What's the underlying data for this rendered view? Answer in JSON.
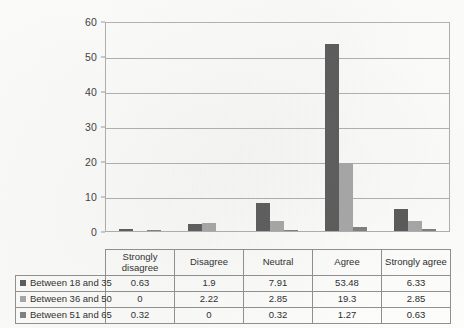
{
  "chart_data": {
    "type": "bar",
    "title": "",
    "subtitle": "",
    "xlabel": "",
    "ylabel": "",
    "categories": [
      "Strongly disagree",
      "Disagree",
      "Neutral",
      "Agree",
      "Strongly agree"
    ],
    "category_labels_wrapped": [
      [
        "Strongly",
        "disagree"
      ],
      [
        "Disagree"
      ],
      [
        "Neutral"
      ],
      [
        "Agree"
      ],
      [
        "Strongly agree"
      ]
    ],
    "series": [
      {
        "name": "Between 18 and 35",
        "color": "#595959",
        "values": [
          0.63,
          1.9,
          7.91,
          53.48,
          6.33
        ]
      },
      {
        "name": "Between 36 and 50",
        "color": "#a6a6a6",
        "values": [
          0,
          2.22,
          2.85,
          19.3,
          2.85
        ]
      },
      {
        "name": "Between 51 and 65",
        "color": "#7f7f7f",
        "values": [
          0.32,
          0,
          0.32,
          1.27,
          0.63
        ]
      }
    ],
    "ylim": [
      0,
      60
    ],
    "yticks": [
      0,
      10,
      20,
      30,
      40,
      50,
      60
    ],
    "ytick_labels": [
      "0",
      "10",
      "20",
      "30",
      "40",
      "50",
      "60"
    ],
    "grid": "horizontal",
    "legend_position": "table-first-column",
    "has_data_table": true
  },
  "table": {
    "corner_label": "",
    "column_headers": [
      "Strongly disagree",
      "Disagree",
      "Neutral",
      "Agree",
      "Strongly agree"
    ],
    "rows": [
      {
        "label": "Between 18 and 35",
        "values": [
          "0.63",
          "1.9",
          "7.91",
          "53.48",
          "6.33"
        ]
      },
      {
        "label": "Between 36 and 50",
        "values": [
          "0",
          "2.22",
          "2.85",
          "19.3",
          "2.85"
        ]
      },
      {
        "label": "Between 51 and 65",
        "values": [
          "0.32",
          "0",
          "0.32",
          "1.27",
          "0.63"
        ]
      }
    ]
  },
  "axis": {
    "y_labels": [
      "60",
      "50",
      "40",
      "30",
      "20",
      "10",
      "0"
    ]
  },
  "colors": {
    "series1": "#595959",
    "series2": "#a6a6a6",
    "series3": "#7f7f7f",
    "gridline": "#b0b0b0",
    "border": "#8f8f8f",
    "text": "#2b2b2b",
    "background": "#fdfdfc"
  }
}
